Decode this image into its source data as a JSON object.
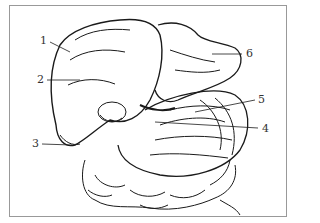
{
  "figure": {
    "labels": [
      {
        "id": "1",
        "text": "1"
      },
      {
        "id": "2",
        "text": "2"
      },
      {
        "id": "3",
        "text": "3"
      },
      {
        "id": "4",
        "text": "4"
      },
      {
        "id": "5",
        "text": "5"
      },
      {
        "id": "6",
        "text": "6"
      }
    ],
    "colors": {
      "line": "#1a1a1a",
      "frame": "#999999",
      "background": "#ffffff"
    }
  }
}
